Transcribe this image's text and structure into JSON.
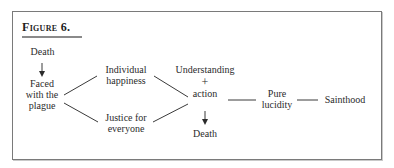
{
  "figure": {
    "title": "Figure 6."
  },
  "nodes": {
    "death_top": {
      "lines": [
        "Death"
      ]
    },
    "faced": {
      "lines": [
        "Faced",
        "with the",
        "plague"
      ]
    },
    "individual": {
      "lines": [
        "Individual",
        "happiness"
      ]
    },
    "justice": {
      "lines": [
        "Justice for",
        "everyone"
      ]
    },
    "understanding": {
      "lines": [
        "Understanding",
        "+",
        "action"
      ]
    },
    "death_bottom": {
      "lines": [
        "Death"
      ]
    },
    "lucidity": {
      "lines": [
        "Pure",
        "lucidity"
      ]
    },
    "sainthood": {
      "lines": [
        "Sainthood"
      ]
    }
  },
  "edges": [
    {
      "from": "Death",
      "to": "Faced with the plague",
      "type": "arrow"
    },
    {
      "from": "Faced with the plague",
      "to": "Individual happiness",
      "type": "line"
    },
    {
      "from": "Faced with the plague",
      "to": "Justice for everyone",
      "type": "line"
    },
    {
      "from": "Individual happiness",
      "to": "Understanding + action",
      "type": "line"
    },
    {
      "from": "Justice for everyone",
      "to": "Understanding + action",
      "type": "line"
    },
    {
      "from": "Understanding + action",
      "to": "Death",
      "type": "arrow"
    },
    {
      "from": "Understanding + action",
      "to": "Pure lucidity",
      "type": "line"
    },
    {
      "from": "Pure lucidity",
      "to": "Sainthood",
      "type": "line"
    }
  ]
}
